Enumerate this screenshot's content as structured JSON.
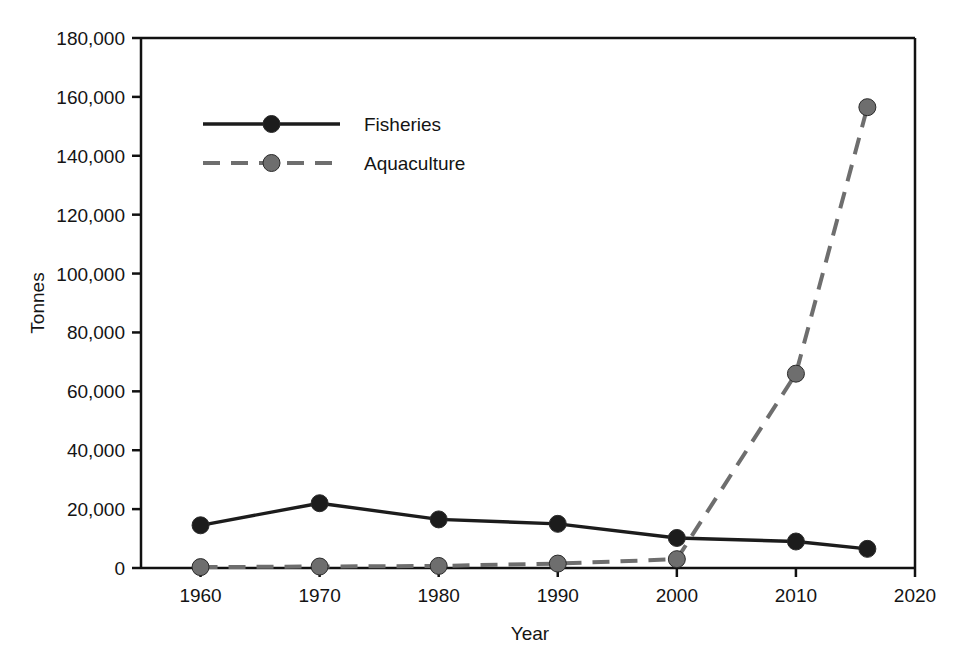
{
  "chart_data": {
    "type": "line",
    "title": "",
    "xlabel": "Year",
    "ylabel": "Tonnes",
    "xlim": [
      1955,
      2020
    ],
    "ylim": [
      0,
      180000
    ],
    "grid": false,
    "legend_position": "top-left-inside",
    "x_ticks": [
      1960,
      1970,
      1980,
      1990,
      2000,
      2010,
      2020
    ],
    "x_tick_labels": [
      "1960",
      "1970",
      "1980",
      "1990",
      "2000",
      "2010",
      "2020"
    ],
    "y_ticks": [
      0,
      20000,
      40000,
      60000,
      80000,
      100000,
      120000,
      140000,
      160000,
      180000
    ],
    "y_tick_labels": [
      "0",
      "20,000",
      "40,000",
      "60,000",
      "80,000",
      "100,000",
      "120,000",
      "140,000",
      "160,000",
      "180,000"
    ],
    "series": [
      {
        "name": "Fisheries",
        "color": "#1c1c1c",
        "linestyle": "solid",
        "marker": "circle",
        "x": [
          1960,
          1970,
          1980,
          1990,
          2000,
          2010,
          2016
        ],
        "values": [
          14500,
          22000,
          16500,
          15000,
          10200,
          9000,
          6500
        ]
      },
      {
        "name": "Aquaculture",
        "color": "#6e6e6e",
        "linestyle": "dashed",
        "marker": "circle",
        "x": [
          1960,
          1970,
          1980,
          1990,
          2000,
          2010,
          2016
        ],
        "values": [
          300,
          500,
          700,
          1500,
          3000,
          66000,
          156500
        ]
      }
    ],
    "legend": [
      {
        "label": "Fisheries",
        "color": "#1c1c1c",
        "linestyle": "solid"
      },
      {
        "label": "Aquaculture",
        "color": "#6e6e6e",
        "linestyle": "dashed"
      }
    ]
  }
}
